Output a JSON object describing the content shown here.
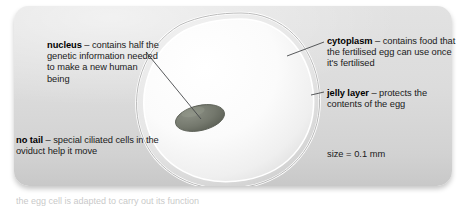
{
  "figure": {
    "panel_color": "#dcdcdc",
    "page_background": "#ffffff"
  },
  "cell": {
    "name": "egg-cell",
    "jelly_ring_color": "#c9c9c9",
    "cytoplasm_color": "#fdfdfd",
    "nucleus_color": "#6e7268",
    "nucleus_label": "nucleus",
    "cytoplasm_label": "cytoplasm",
    "jelly_label": "jelly layer"
  },
  "labels": {
    "nucleus": {
      "term": "nucleus",
      "dash": " – ",
      "text": "contains half the genetic information needed to make a new human being"
    },
    "no_tail": {
      "term": "no tail",
      "dash": " – ",
      "text": "special ciliated cells in the oviduct help it move"
    },
    "cytoplasm": {
      "term": "cytoplasm",
      "dash": " – ",
      "text": "contains food that the fertilised egg can use once it's fertilised"
    },
    "jelly_layer": {
      "term": "jelly layer",
      "dash": " – ",
      "text": "protects the contents of the egg"
    },
    "size": {
      "text": "size = 0.1 mm"
    }
  },
  "caption_sliver": {
    "text": "the egg cell is adapted to carry out its function"
  }
}
